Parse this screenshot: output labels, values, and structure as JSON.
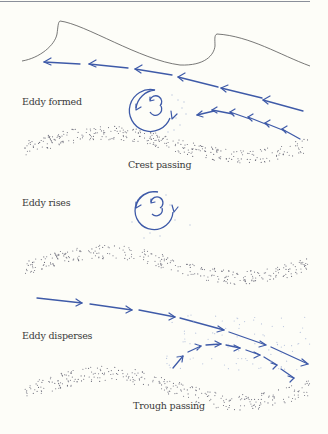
{
  "figure": {
    "panels": [
      {
        "id": "crest",
        "eddy_label": "Eddy formed",
        "caption": "Crest passing",
        "flow_direction": "left",
        "eddy_rotation": "counterclockwise"
      },
      {
        "id": "rise",
        "eddy_label": "Eddy rises",
        "caption": "",
        "eddy_rotation": "counterclockwise"
      },
      {
        "id": "trough",
        "eddy_label": "Eddy disperses",
        "caption": "Trough passing",
        "flow_direction": "right"
      }
    ],
    "colors": {
      "flow_arrows": "#3e5aa8",
      "wave_surface": "#555555",
      "sand_grains": "#6a6a78",
      "suspended_sediment": "#b9c4dd",
      "background": "#fdfdf8"
    }
  }
}
